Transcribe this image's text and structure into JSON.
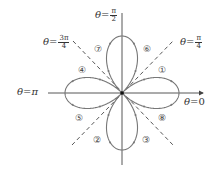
{
  "diagram": {
    "type": "polar rose curve (four-leaved rose, r = cos 2θ)",
    "origin": [
      122,
      93
    ],
    "petal_radius": 57,
    "colors": {
      "curve": "#777777",
      "axes": "#444444",
      "dashed": "#444444",
      "text": "#333333"
    },
    "axis_labels": {
      "top": {
        "lhs": "θ",
        "eq": "=",
        "num": "π",
        "den": "2"
      },
      "top_right": {
        "lhs": "θ",
        "eq": "=",
        "num": "π",
        "den": "4"
      },
      "top_left": {
        "lhs": "θ",
        "eq": "=",
        "num": "3π",
        "den": "4"
      },
      "left": {
        "lhs": "θ",
        "eq": "=",
        "rhs": "π"
      },
      "right": {
        "lhs": "θ",
        "eq": "=",
        "rhs": "0"
      }
    },
    "loop_markers": [
      {
        "label": "①",
        "x": 162,
        "y": 70
      },
      {
        "label": "②",
        "x": 97,
        "y": 140
      },
      {
        "label": "③",
        "x": 146,
        "y": 140
      },
      {
        "label": "④",
        "x": 82,
        "y": 70
      },
      {
        "label": "⑤",
        "x": 79,
        "y": 118
      },
      {
        "label": "⑥",
        "x": 147,
        "y": 49
      },
      {
        "label": "⑦",
        "x": 98,
        "y": 49
      },
      {
        "label": "⑧",
        "x": 162,
        "y": 118
      }
    ]
  }
}
